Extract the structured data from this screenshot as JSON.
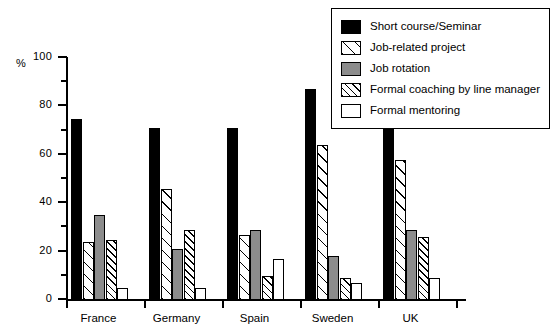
{
  "chart_data": {
    "type": "bar",
    "title": "",
    "xlabel": "",
    "ylabel": "%",
    "ylim": [
      0,
      100
    ],
    "ytick_step": 20,
    "yminor_step": 10,
    "grid": false,
    "legend_position": "top-right",
    "ytick_labels": [
      "100",
      "80",
      "60",
      "40",
      "20",
      "0"
    ],
    "categories": [
      "France",
      "Germany",
      "Spain",
      "Sweden",
      "UK"
    ],
    "series": [
      {
        "name": "Short course/Seminar",
        "swatch": "solid-black",
        "color": "#000000",
        "values": [
          75,
          71,
          71,
          87,
          88
        ]
      },
      {
        "name": "Job-related project",
        "swatch": "hatch-sparse",
        "color": "#ffffff",
        "values": [
          24,
          46,
          27,
          64,
          58
        ]
      },
      {
        "name": "Job rotation",
        "swatch": "solid-gray",
        "color": "#8c8c8c",
        "values": [
          35,
          21,
          29,
          18,
          29
        ]
      },
      {
        "name": "Formal coaching by line manager",
        "swatch": "hatch-dense",
        "color": "#ffffff",
        "values": [
          25,
          29,
          10,
          9,
          26
        ]
      },
      {
        "name": "Formal mentoring",
        "swatch": "white",
        "color": "#ffffff",
        "values": [
          5,
          5,
          17,
          7,
          9
        ]
      }
    ]
  },
  "axis": {
    "unit_label": "%"
  }
}
